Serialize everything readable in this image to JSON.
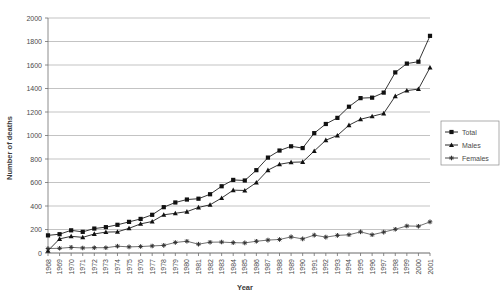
{
  "chart_data": {
    "type": "line",
    "title": "",
    "xlabel": "Year",
    "ylabel": "Number of deaths",
    "categories": [
      1968,
      1969,
      1970,
      1971,
      1972,
      1973,
      1974,
      1975,
      1976,
      1977,
      1978,
      1979,
      1980,
      1981,
      1982,
      1983,
      1984,
      1985,
      1986,
      1987,
      1988,
      1989,
      1990,
      1991,
      1992,
      1993,
      1994,
      1995,
      1996,
      1997,
      1998,
      1999,
      2000,
      2001
    ],
    "xtick_labels": [
      "1968",
      "1969",
      "1970",
      "1971",
      "1972",
      "1973",
      "1974",
      "1975",
      "1976",
      "1977",
      "1978",
      "1979",
      "1980",
      "1981",
      "1982",
      "1983",
      "1984",
      "1985",
      "1986",
      "1987",
      "1988",
      "1989",
      "1990",
      "1991",
      "1992",
      "1993",
      "1994",
      "1995",
      "1996",
      "1997",
      "1998",
      "1999",
      "2000",
      "2001"
    ],
    "ytick_labels": [
      "0",
      "200",
      "400",
      "600",
      "800",
      "1000",
      "1200",
      "1400",
      "1600",
      "1800",
      "2000"
    ],
    "ylim": [
      0,
      2000
    ],
    "ytick_step": 200,
    "grid": "horizontal",
    "legend_position": "right-outside",
    "series": [
      {
        "name": "Total",
        "marker": "square",
        "color": "#111111",
        "values": [
          150,
          160,
          193,
          180,
          208,
          220,
          240,
          265,
          290,
          325,
          390,
          430,
          455,
          462,
          500,
          568,
          622,
          617,
          705,
          812,
          872,
          908,
          893,
          1020,
          1098,
          1150,
          1245,
          1318,
          1322,
          1365,
          1537,
          1612,
          1628,
          1848
        ]
      },
      {
        "name": "Males",
        "marker": "triangle",
        "color": "#111111",
        "values": [
          20,
          120,
          142,
          133,
          162,
          178,
          180,
          210,
          248,
          268,
          325,
          338,
          352,
          388,
          410,
          468,
          535,
          532,
          600,
          705,
          755,
          772,
          775,
          868,
          960,
          1000,
          1088,
          1138,
          1163,
          1188,
          1335,
          1382,
          1395,
          1578
        ]
      },
      {
        "name": "Females",
        "marker": "plus",
        "color": "#333333",
        "values": [
          38,
          40,
          48,
          43,
          45,
          45,
          58,
          52,
          55,
          60,
          65,
          90,
          100,
          75,
          92,
          93,
          88,
          86,
          100,
          110,
          115,
          137,
          120,
          152,
          135,
          150,
          155,
          180,
          155,
          178,
          202,
          230,
          228,
          265
        ]
      }
    ]
  },
  "legend": {
    "entries": [
      {
        "label": "Total",
        "marker": "square"
      },
      {
        "label": "Males",
        "marker": "triangle"
      },
      {
        "label": "Females",
        "marker": "plus"
      }
    ]
  },
  "axes": {
    "y_title": "Number of deaths",
    "x_title": "Year"
  }
}
